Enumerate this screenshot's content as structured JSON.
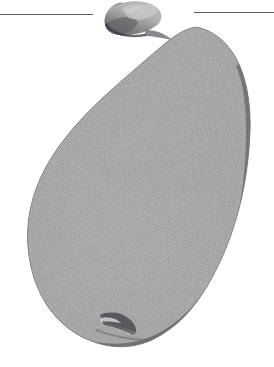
{
  "page": {
    "width": 274,
    "height": 367,
    "background_color": "#ffffff",
    "kind": "scanned-halftone-photograph",
    "subject_label": "pear"
  },
  "rules": [
    {
      "name": "rule-left",
      "x": 0,
      "y": 14,
      "width": 93,
      "color": "#5a5a5a"
    },
    {
      "name": "rule-right",
      "x": 194,
      "y": 12,
      "width": 80,
      "color": "#5a5a5a"
    }
  ],
  "figure": {
    "name": "pear-photograph",
    "alt_text": "Black and white halftone photograph of a whole pear with a curved stem",
    "parts": [
      {
        "name": "stem",
        "label": "stem"
      },
      {
        "name": "body",
        "label": "body"
      },
      {
        "name": "calyx",
        "label": "calyx"
      }
    ],
    "palette": {
      "highlight": "#d8d8d6",
      "light": "#bdbdbb",
      "midtone": "#9a9a99",
      "shade": "#7c7c7e",
      "dark": "#636368",
      "edge": "#4c4c52",
      "stem_light": "#c2c2be",
      "stem_dark": "#55555a",
      "background": "#ffffff"
    },
    "geometry": {
      "body_top_y": 26,
      "body_bottom_y": 346,
      "body_left_x": 27,
      "body_right_x": 250,
      "stem_left_x": 104,
      "stem_right_x": 162,
      "stem_top_y": 1
    }
  }
}
